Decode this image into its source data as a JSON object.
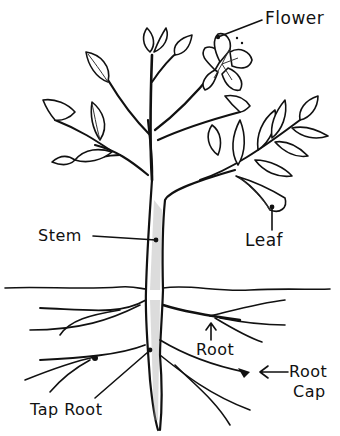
{
  "diagram": {
    "labels": {
      "flower": "Flower",
      "stem": "Stem",
      "leaf": "Leaf",
      "root": "Root",
      "root_cap_line1": "Root",
      "root_cap_line2": "Cap",
      "tap_root": "Tap Root"
    },
    "colors": {
      "ink": "#111111",
      "background": "#ffffff",
      "shading": "#9a9a9a"
    }
  }
}
